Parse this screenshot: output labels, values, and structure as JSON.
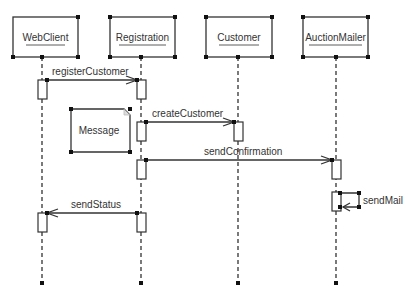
{
  "diagram": {
    "type": "UML sequence diagram",
    "colors": {
      "line": "#333333",
      "background": "#ffffff",
      "note_fold": "#bbbbbb"
    },
    "lifelines": [
      {
        "name": "WebClient",
        "x": 42
      },
      {
        "name": "Registration",
        "x": 141
      },
      {
        "name": "Customer",
        "x": 238
      },
      {
        "name": "AuctionMailer",
        "x": 336
      }
    ],
    "messages": [
      {
        "label": "registerCustomer",
        "from": "WebClient",
        "to": "Registration",
        "y": 80
      },
      {
        "label": "createCustomer",
        "from": "Registration",
        "to": "Customer",
        "y": 122
      },
      {
        "label": "sendConfirmation",
        "from": "Registration",
        "to": "AuctionMailer",
        "y": 160
      },
      {
        "label": "sendMail",
        "from": "AuctionMailer",
        "to": "AuctionMailer",
        "y": 192
      },
      {
        "label": "sendStatus",
        "from": "Registration",
        "to": "WebClient",
        "y": 213
      }
    ],
    "note": {
      "text": "Message"
    }
  }
}
